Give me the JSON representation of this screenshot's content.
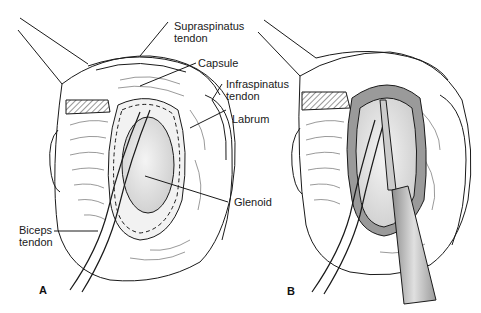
{
  "figure": {
    "panels": [
      {
        "id": "A",
        "letter": "A",
        "labels": {
          "supraspinatus": "Supraspinatus\ntendon",
          "capsule": "Capsule",
          "infraspinatus": "Infraspinatus\ntendon",
          "labrum": "Labrum",
          "glenoid": "Glenoid",
          "biceps": "Biceps\ntendon"
        }
      },
      {
        "id": "B",
        "letter": "B"
      }
    ],
    "colors": {
      "line": "#1a1a1a",
      "glenoid_fill": "#e4e4e4",
      "labrum_fill": "#efefef",
      "shaded_fill": "#9a9a9a",
      "instrument_fill": "#bdbdbd",
      "background": "#ffffff"
    }
  }
}
